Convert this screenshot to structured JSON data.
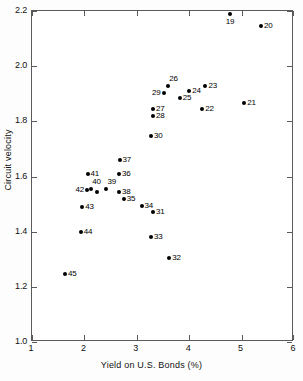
{
  "chart_data": {
    "type": "scatter",
    "title": "",
    "xlabel": "Yield on U.S. Bonds (%)",
    "ylabel": "Circuit velocity",
    "xlim": [
      1,
      6
    ],
    "ylim": [
      1.0,
      2.2
    ],
    "xticks": [
      "1",
      "2",
      "3",
      "4",
      "5",
      "6"
    ],
    "yticks": [
      "1.0",
      "1.2",
      "1.4",
      "1.6",
      "1.8",
      "2.0",
      "2.2"
    ],
    "grid": false,
    "legend": "none",
    "points": [
      {
        "label": "19",
        "x": 4.78,
        "y": 2.19,
        "lab_pos": "below"
      },
      {
        "label": "20",
        "x": 5.37,
        "y": 2.145,
        "lab_pos": "right"
      },
      {
        "label": "26",
        "x": 3.6,
        "y": 1.928,
        "lab_pos": "above-right"
      },
      {
        "label": "23",
        "x": 4.31,
        "y": 1.928,
        "lab_pos": "right"
      },
      {
        "label": "29",
        "x": 3.51,
        "y": 1.903,
        "lab_pos": "left"
      },
      {
        "label": "24",
        "x": 4.0,
        "y": 1.91,
        "lab_pos": "right"
      },
      {
        "label": "25",
        "x": 3.82,
        "y": 1.885,
        "lab_pos": "right"
      },
      {
        "label": "27",
        "x": 3.31,
        "y": 1.845,
        "lab_pos": "right"
      },
      {
        "label": "22",
        "x": 4.25,
        "y": 1.843,
        "lab_pos": "right"
      },
      {
        "label": "21",
        "x": 5.05,
        "y": 1.865,
        "lab_pos": "right"
      },
      {
        "label": "28",
        "x": 3.31,
        "y": 1.818,
        "lab_pos": "right"
      },
      {
        "label": "30",
        "x": 3.27,
        "y": 1.748,
        "lab_pos": "right"
      },
      {
        "label": "37",
        "x": 2.67,
        "y": 1.66,
        "lab_pos": "right"
      },
      {
        "label": "41",
        "x": 2.06,
        "y": 1.61,
        "lab_pos": "right"
      },
      {
        "label": "36",
        "x": 2.66,
        "y": 1.608,
        "lab_pos": "right"
      },
      {
        "label": "40",
        "x": 2.13,
        "y": 1.553,
        "lab_pos": "above-right"
      },
      {
        "label": "39",
        "x": 2.42,
        "y": 1.555,
        "lab_pos": "above-right"
      },
      {
        "label": "42",
        "x": 2.05,
        "y": 1.551,
        "lab_pos": "left"
      },
      {
        "label": "38",
        "x": 2.66,
        "y": 1.543,
        "lab_pos": "right"
      },
      {
        "label": "33b",
        "x": 2.24,
        "y": 1.545,
        "lab_pos": "none"
      },
      {
        "label": "35",
        "x": 2.75,
        "y": 1.519,
        "lab_pos": "right"
      },
      {
        "label": "34",
        "x": 3.09,
        "y": 1.493,
        "lab_pos": "right"
      },
      {
        "label": "43",
        "x": 1.96,
        "y": 1.489,
        "lab_pos": "right"
      },
      {
        "label": "31",
        "x": 3.31,
        "y": 1.473,
        "lab_pos": "right"
      },
      {
        "label": "44",
        "x": 1.93,
        "y": 1.398,
        "lab_pos": "right"
      },
      {
        "label": "33",
        "x": 3.27,
        "y": 1.38,
        "lab_pos": "right"
      },
      {
        "label": "32",
        "x": 3.62,
        "y": 1.303,
        "lab_pos": "right"
      },
      {
        "label": "45",
        "x": 1.63,
        "y": 1.248,
        "lab_pos": "right"
      }
    ]
  }
}
